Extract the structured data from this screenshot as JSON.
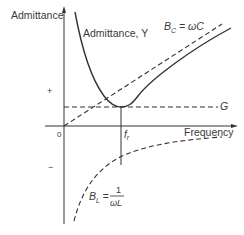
{
  "diagram": {
    "y_axis_label": "Admittance",
    "x_axis_label": "Frequency",
    "origin_label": "0",
    "plus_sign": "+",
    "minus_sign": "−",
    "curves": {
      "admittance": {
        "label": "Admittance, Y",
        "style": "solid"
      },
      "capacitive": {
        "label_main": "B",
        "label_sub": "C",
        "label_rest": " = ωC",
        "style": "dashed"
      },
      "conductance": {
        "label": "G",
        "style": "dashed"
      },
      "inductive": {
        "label_main": "B",
        "label_sub": "L",
        "label_eq": " = ",
        "numerator": "1",
        "denominator": "ωL",
        "style": "dashed"
      }
    },
    "resonance": {
      "label_main": "f",
      "label_sub": "r"
    },
    "colors": {
      "ink": "#333333",
      "background": "#ffffff"
    }
  }
}
